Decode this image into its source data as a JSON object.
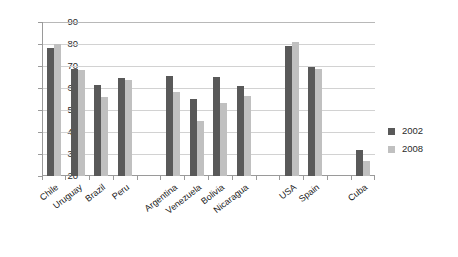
{
  "chart_data": {
    "type": "bar",
    "title": "",
    "subtitle": "",
    "xlabel": "",
    "ylabel": "",
    "ylim": [
      20,
      90
    ],
    "yticks": [
      90,
      80,
      70,
      60,
      50,
      40,
      30,
      20
    ],
    "grid": true,
    "legend_position": "right",
    "categories": [
      "Chile",
      "Uruguay",
      "Brazil",
      "Peru",
      "",
      "Argentina",
      "Venezuela",
      "Bolivia",
      "Nicaragua",
      "",
      "USA",
      "Spain",
      "",
      "Cuba"
    ],
    "series": [
      {
        "name": "2002",
        "color": "#595959",
        "values": [
          78,
          68.5,
          61.5,
          64.5,
          null,
          65.5,
          55,
          65,
          61,
          null,
          79,
          69.5,
          null,
          32
        ]
      },
      {
        "name": "2008",
        "color": "#c0c0c0",
        "values": [
          80,
          68,
          56,
          63.5,
          null,
          58,
          45,
          53,
          56.5,
          null,
          81,
          68.5,
          null,
          27
        ]
      }
    ]
  },
  "legend": {
    "items": [
      {
        "label": "2002",
        "color": "#595959"
      },
      {
        "label": "2008",
        "color": "#c0c0c0"
      }
    ]
  },
  "axis": {
    "y_tick_labels": [
      "90",
      "80",
      "70",
      "60",
      "50",
      "40",
      "30",
      "20"
    ]
  },
  "colors": {
    "series_2002": "#595959",
    "series_2008": "#c0c0c0",
    "gridline": "#d2d2d2",
    "axis": "#9a9a9a",
    "text": "#1a1a1a",
    "background": "#ffffff"
  }
}
